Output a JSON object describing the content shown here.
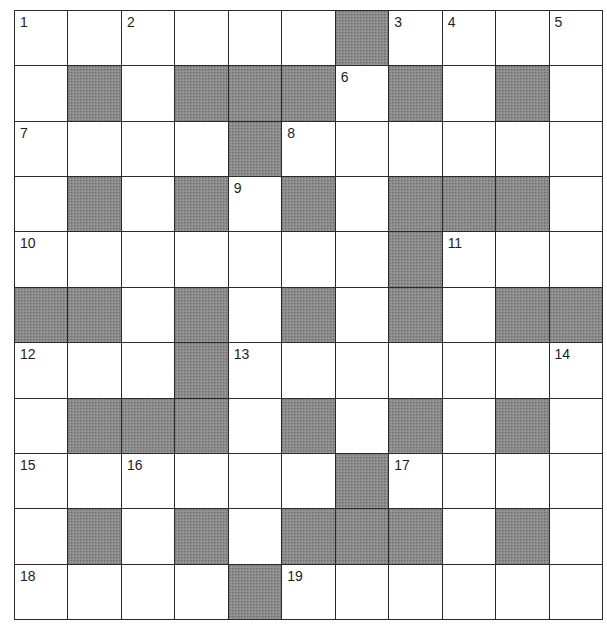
{
  "puzzle": {
    "type": "crossword",
    "rows": 11,
    "cols": 11,
    "colors": {
      "block": "#8c8c8c",
      "line": "#2a2a2a",
      "cell": "#ffffff"
    },
    "grid": [
      [
        "1",
        "",
        "2",
        "",
        "",
        "",
        "#",
        "3",
        "4",
        "",
        "5"
      ],
      [
        "",
        "#",
        "",
        "#",
        "#",
        "#",
        "6",
        "#",
        "",
        "#",
        ""
      ],
      [
        "7",
        "",
        "",
        "",
        "#",
        "8",
        "",
        "",
        "",
        "",
        ""
      ],
      [
        "",
        "#",
        "",
        "#",
        "9",
        "#",
        "",
        "#",
        "#",
        "#",
        ""
      ],
      [
        "10",
        "",
        "",
        "",
        "",
        "",
        "",
        "#",
        "11",
        "",
        ""
      ],
      [
        "#",
        "#",
        "",
        "#",
        "",
        "#",
        "",
        "#",
        "",
        "#",
        "#"
      ],
      [
        "12",
        "",
        "",
        "#",
        "13",
        "",
        "",
        "",
        "",
        "",
        "14"
      ],
      [
        "",
        "#",
        "#",
        "#",
        "",
        "#",
        "",
        "#",
        "",
        "#",
        ""
      ],
      [
        "15",
        "",
        "16",
        "",
        "",
        "",
        "#",
        "17",
        "",
        "",
        ""
      ],
      [
        "",
        "#",
        "",
        "#",
        "",
        "#",
        "#",
        "#",
        "",
        "#",
        ""
      ],
      [
        "18",
        "",
        "",
        "",
        "#",
        "19",
        "",
        "",
        "",
        "",
        ""
      ]
    ],
    "clue_numbers": [
      "1",
      "2",
      "3",
      "4",
      "5",
      "6",
      "7",
      "8",
      "9",
      "10",
      "11",
      "12",
      "13",
      "14",
      "15",
      "16",
      "17",
      "18",
      "19"
    ]
  }
}
